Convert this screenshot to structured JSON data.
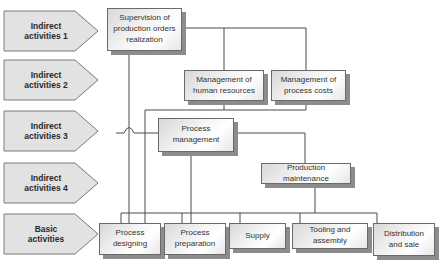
{
  "levels": [
    {
      "label": "Indirect activities 1",
      "line1": "Indirect",
      "line2": "activities 1"
    },
    {
      "label": "Indirect activities 2",
      "line1": "Indirect",
      "line2": "activities 2"
    },
    {
      "label": "Indirect activities 3",
      "line1": "Indirect",
      "line2": "activities 3"
    },
    {
      "label": "Indirect activities 4",
      "line1": "Indirect",
      "line2": "activities 4"
    },
    {
      "label": "Basic activities",
      "line1": "Basic",
      "line2": "activities"
    }
  ],
  "nodes": {
    "supervision": {
      "line1": "Supervision of",
      "line2": "production orders",
      "line3": "realization"
    },
    "human_resources": {
      "line1": "Management of",
      "line2": "human resources"
    },
    "process_costs": {
      "line1": "Management of",
      "line2": "process costs"
    },
    "process_management": {
      "line1": "Process",
      "line2": "management"
    },
    "production_maintenance": {
      "line1": "Production maintenance"
    },
    "process_designing": {
      "line1": "Process",
      "line2": "designing"
    },
    "process_preparation": {
      "line1": "Process",
      "line2": "preparation"
    },
    "supply": {
      "line1": "Supply"
    },
    "tooling_assembly": {
      "line1": "Tooling and assembly"
    },
    "distribution_sale": {
      "line1": "Distribution",
      "line2": "and sale"
    }
  },
  "colors": {
    "line": "#4a4a4a",
    "box_border": "#6a6a6a",
    "shadow": "#8c8c8c",
    "chevron_fill": "#e2e2e2"
  }
}
